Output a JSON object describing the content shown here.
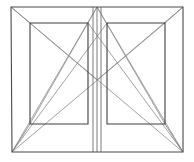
{
  "figure": {
    "width": 194,
    "height": 162,
    "background_color": "#ffffff",
    "stroke_colors": {
      "frame": "#4a4a4a",
      "inner_panel": "#3f3f3f",
      "diagonal": "#8c8c8c",
      "divider": "#6e6e6e"
    },
    "stroke_widths": {
      "frame": 1.1,
      "inner_panel": 1.1,
      "diagonal": 0.8,
      "divider": 0.9
    },
    "points": {
      "outer_top_left": [
        11,
        7
      ],
      "outer_top_right": [
        183,
        7
      ],
      "outer_bottom_right": [
        183,
        152
      ],
      "outer_bottom_left": [
        12,
        152
      ],
      "apex_top_center": [
        97,
        7
      ],
      "center_bottom": [
        97,
        152
      ],
      "left_panel_top_left": [
        30,
        23
      ],
      "left_panel_top_right": [
        88,
        23
      ],
      "left_panel_bottom_right": [
        88,
        124
      ],
      "left_panel_bottom_left": [
        30,
        124
      ],
      "right_panel_top_left": [
        107,
        23
      ],
      "right_panel_top_right": [
        165,
        23
      ],
      "right_panel_bottom_right": [
        165,
        124
      ],
      "right_panel_bottom_left": [
        107,
        124
      ],
      "crossing_left": [
        69,
        55
      ],
      "crossing_center": [
        97,
        80
      ],
      "crossing_right": [
        124,
        55
      ]
    },
    "shapes": {
      "outer_frame": "11,7 183,7 183,152 12,152",
      "left_panel": "30,23 88,23 88,124 30,124",
      "right_panel": "107,23 165,23 165,124 107,124"
    },
    "lines": {
      "center_divider": [
        97,
        7,
        97,
        152
      ],
      "left_panel_inner_vertical": [
        93,
        7,
        93,
        152
      ],
      "right_panel_inner_vertical": [
        101,
        7,
        101,
        152
      ],
      "frame_corner_tl_to_panel": [
        11,
        7,
        30,
        23
      ],
      "frame_corner_tr_to_panel": [
        183,
        7,
        165,
        23
      ],
      "frame_corner_bl_to_panel": [
        12,
        152,
        30,
        124
      ],
      "frame_corner_br_to_panel": [
        183,
        152,
        165,
        124
      ],
      "diagonal_bl_to_apex": [
        12,
        152,
        97,
        7
      ],
      "diagonal_br_to_apex": [
        183,
        152,
        97,
        7
      ],
      "diagonal_bl_to_right_panel_tr": [
        12,
        152,
        165,
        23
      ],
      "diagonal_br_to_left_panel_tl": [
        183,
        152,
        30,
        23
      ],
      "diagonal_bl_to_right_panel_tl": [
        12,
        152,
        107,
        23
      ],
      "diagonal_br_to_left_panel_tr": [
        183,
        152,
        88,
        23
      ],
      "diagonal_apex_to_left_panel_bl": [
        97,
        7,
        30,
        124
      ],
      "diagonal_apex_to_right_panel_br": [
        97,
        7,
        165,
        124
      ],
      "diagonal_tl_to_center": [
        11,
        7,
        97,
        80
      ],
      "diagonal_tr_to_center": [
        183,
        7,
        97,
        80
      ]
    }
  }
}
